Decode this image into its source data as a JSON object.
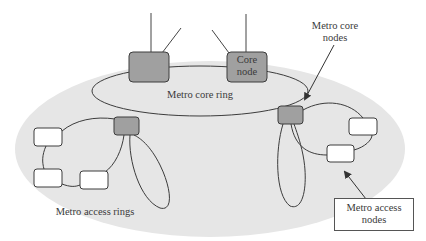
{
  "diagram": {
    "colors": {
      "background": "#ffffff",
      "metro_region_fill": "#e6e6e6",
      "core_node_fill": "#a0a0a0",
      "access_node_fill": "#ffffff",
      "stroke": "#3c3c3c",
      "text": "#3a3a3a"
    },
    "labels": {
      "metro_core_ring": "Metro core ring",
      "core_node_line1": "Core",
      "core_node_line2": "node",
      "metro_core_nodes_line1": "Metro core",
      "metro_core_nodes_line2": "nodes",
      "metro_access_rings": "Metro access rings",
      "metro_access_nodes_line1": "Metro access",
      "metro_access_nodes_line2": "nodes"
    },
    "nodes": [
      {
        "id": "core-node-left",
        "type": "core",
        "label": ""
      },
      {
        "id": "core-node-right",
        "type": "core",
        "label": "Core node"
      },
      {
        "id": "metro-core-node-left",
        "type": "metro-core",
        "label": ""
      },
      {
        "id": "metro-core-node-right",
        "type": "metro-core",
        "label": ""
      },
      {
        "id": "access-node-l1",
        "type": "access",
        "label": ""
      },
      {
        "id": "access-node-l2",
        "type": "access",
        "label": ""
      },
      {
        "id": "access-node-l3",
        "type": "access",
        "label": ""
      },
      {
        "id": "access-node-r1",
        "type": "access",
        "label": ""
      },
      {
        "id": "access-node-r2",
        "type": "access",
        "label": ""
      }
    ],
    "rings": [
      {
        "id": "metro-core-ring",
        "label": "Metro core ring"
      },
      {
        "id": "metro-access-ring-left-loop",
        "label": "Metro access rings"
      },
      {
        "id": "metro-access-ring-left-ellipse",
        "label": "Metro access rings"
      },
      {
        "id": "metro-access-ring-right-loop",
        "label": ""
      },
      {
        "id": "metro-access-ring-right-ellipse",
        "label": ""
      }
    ]
  }
}
